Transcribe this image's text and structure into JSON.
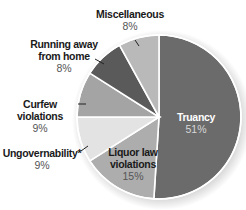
{
  "chart_data": {
    "type": "pie",
    "title": "",
    "start_angle_deg": 0,
    "direction": "clockwise",
    "slices": [
      {
        "label": "Truancy",
        "value": 51,
        "display": "51%",
        "color": "#6b6b6b"
      },
      {
        "label": "Liquor law violations",
        "value": 15,
        "display": "15%",
        "color": "#adadad"
      },
      {
        "label": "Ungovernability*",
        "value": 9,
        "display": "9%",
        "color": "#e3e3e3"
      },
      {
        "label": "Curfew violations",
        "value": 9,
        "display": "9%",
        "color": "#a4a4a4"
      },
      {
        "label": "Running away from home",
        "value": 8,
        "display": "8%",
        "color": "#5a5a5a"
      },
      {
        "label": "Miscellaneous",
        "value": 8,
        "display": "8%",
        "color": "#b9b9b9"
      }
    ]
  },
  "labels": {
    "truancy": {
      "name": "Truancy",
      "pct": "51%"
    },
    "liquor": {
      "name_line1": "Liquor law",
      "name_line2": "violations",
      "pct": "15%"
    },
    "ungov": {
      "name": "Ungovernability*",
      "pct": "9%"
    },
    "curfew": {
      "name": "Curfew violations",
      "pct": "9%"
    },
    "running": {
      "name_line1": "Running away",
      "name_line2": "from home",
      "pct": "8%"
    },
    "misc": {
      "name": "Miscellaneous",
      "pct": "8%"
    }
  }
}
